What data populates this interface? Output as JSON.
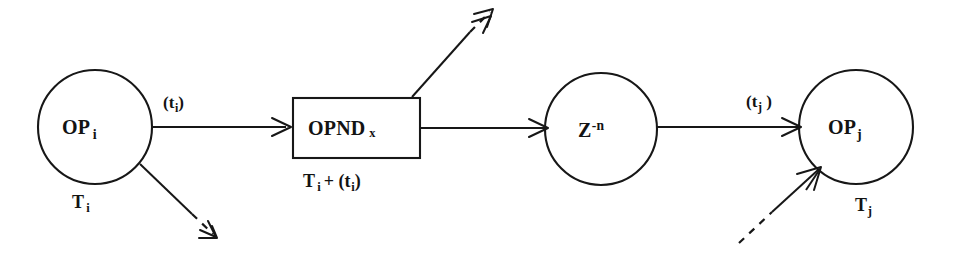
{
  "diagram": {
    "background_color": "#ffffff",
    "ink_color": "#171717",
    "nodes": [
      {
        "id": "op-i",
        "shape": "circle",
        "label_main": "OP",
        "label_sub": "i",
        "time_label_main": "T",
        "time_label_sub": "i",
        "cx": 95,
        "cy": 127,
        "r": 57
      },
      {
        "id": "opnd-x",
        "shape": "rectangle",
        "label_main": "OPND",
        "label_sub": "x",
        "time_label": "T_i + (t_i)",
        "x": 293,
        "y": 98,
        "width": 127,
        "height": 60
      },
      {
        "id": "z-delay",
        "shape": "circle",
        "label_main": "Z",
        "label_sup": "-n",
        "cx": 601,
        "cy": 129,
        "r": 56
      },
      {
        "id": "op-j",
        "shape": "circle",
        "label_main": "OP",
        "label_sub": "j",
        "time_label_main": "T",
        "time_label_sub": "j",
        "cx": 856,
        "cy": 127,
        "r": 57
      }
    ],
    "edges": [
      {
        "id": "edge-opi-to-opnd",
        "from": "op-i",
        "to": "opnd-x",
        "style": "solid",
        "label_main": "(t",
        "label_sub": "i",
        "label_close": ")"
      },
      {
        "id": "edge-opnd-to-z",
        "from": "opnd-x",
        "to": "z-delay",
        "style": "solid",
        "label": ""
      },
      {
        "id": "edge-z-to-opj",
        "from": "z-delay",
        "to": "op-j",
        "style": "solid",
        "label_main": "(t",
        "label_sub": "j",
        "label_close": " )"
      },
      {
        "id": "edge-opi-out-dashed",
        "from": "op-i",
        "to": "external",
        "style": "solid-to-dashed",
        "direction": "down-right",
        "label": ""
      },
      {
        "id": "edge-opnd-out-dashed",
        "from": "opnd-x",
        "to": "external",
        "style": "solid-to-dashed",
        "direction": "up-right",
        "label": ""
      },
      {
        "id": "edge-external-to-opj",
        "from": "external",
        "to": "op-j",
        "style": "dashed-to-solid",
        "direction": "up-right",
        "label": ""
      }
    ],
    "labels": {
      "op_i_main": "OP",
      "op_i_sub": "i",
      "op_i_time_main": "T",
      "op_i_time_sub": "i",
      "edge_ti_open": "(t",
      "edge_ti_sub": "i",
      "edge_ti_close": ")",
      "opnd_main": "OPND",
      "opnd_sub": "x",
      "opnd_time_t": "T",
      "opnd_time_t_sub": "i",
      "opnd_time_plus": "+ (t",
      "opnd_time_plus_sub": "i",
      "opnd_time_close": ")",
      "z_main": "Z",
      "z_sup": "-n",
      "edge_tj_open": "(t",
      "edge_tj_sub": "j",
      "edge_tj_close": " )",
      "op_j_main": "OP",
      "op_j_sub": "j",
      "op_j_time_main": "T",
      "op_j_time_sub": "j"
    }
  }
}
